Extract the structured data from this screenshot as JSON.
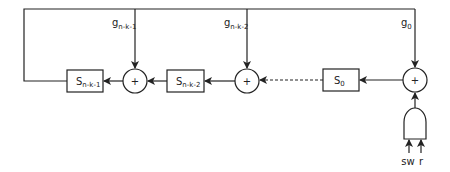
{
  "diagram": {
    "registers": [
      {
        "main": "S",
        "sub": "n-k-1"
      },
      {
        "main": "S",
        "sub": "n-k-2"
      },
      {
        "main": "S",
        "sub": "0"
      }
    ],
    "taps": [
      {
        "main": "g",
        "sub": "n-k-1"
      },
      {
        "main": "g",
        "sub": "n-k-2"
      },
      {
        "main": "g",
        "sub": "0"
      }
    ],
    "adder_symbol": "+",
    "gate_inputs": [
      "sw",
      "r"
    ]
  }
}
